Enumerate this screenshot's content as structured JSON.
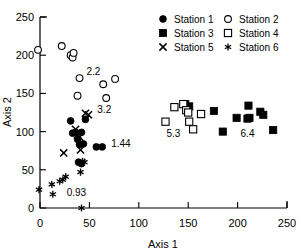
{
  "chart_data": {
    "type": "scatter",
    "title": "",
    "xlabel": "Axis 1",
    "ylabel": "Axis 2",
    "xlim": [
      0,
      250
    ],
    "ylim": [
      0,
      250
    ],
    "xticks": [
      0,
      50,
      100,
      150,
      200,
      250
    ],
    "yticks": [
      0,
      50,
      100,
      150,
      200,
      250
    ],
    "xtick_labels": [
      "0",
      "50",
      "100",
      "150",
      "200",
      "250"
    ],
    "ytick_labels": [
      "0",
      "50",
      "100",
      "150",
      "200",
      "250"
    ],
    "grid": false,
    "legend_position": "top-right",
    "series": [
      {
        "name": "Station 1",
        "marker": "filled-circle",
        "color": "#000000",
        "points": [
          [
            31,
            114
          ],
          [
            33,
            98
          ],
          [
            36,
            99
          ],
          [
            38,
            90
          ],
          [
            40,
            83
          ],
          [
            42,
            99
          ],
          [
            44,
            84
          ],
          [
            46,
            116
          ],
          [
            39,
            60
          ],
          [
            42,
            58
          ],
          [
            57,
            80
          ],
          [
            63,
            80
          ]
        ]
      },
      {
        "name": "Station 2",
        "marker": "open-circle",
        "color": "#000000",
        "points": [
          [
            -2,
            207
          ],
          [
            22,
            212
          ],
          [
            31,
            200
          ],
          [
            33,
            197
          ],
          [
            34,
            203
          ],
          [
            40,
            170
          ],
          [
            38,
            147
          ],
          [
            64,
            162
          ],
          [
            67,
            144
          ],
          [
            76,
            169
          ]
        ]
      },
      {
        "name": "Station 3",
        "marker": "filled-square",
        "color": "#000000",
        "points": [
          [
            147,
            136
          ],
          [
            151,
            133
          ],
          [
            176,
            127
          ],
          [
            185,
            100
          ],
          [
            199,
            118
          ],
          [
            210,
            117
          ],
          [
            211,
            134
          ],
          [
            212,
            118
          ],
          [
            223,
            126
          ],
          [
            226,
            122
          ],
          [
            236,
            102
          ]
        ]
      },
      {
        "name": "Station 4",
        "marker": "open-square",
        "color": "#000000",
        "points": [
          [
            127,
            113
          ],
          [
            136,
            132
          ],
          [
            145,
            136
          ],
          [
            148,
            128
          ],
          [
            150,
            125
          ],
          [
            151,
            113
          ],
          [
            155,
            103
          ],
          [
            163,
            123
          ]
        ]
      },
      {
        "name": "Station 5",
        "marker": "x",
        "color": "#000000",
        "points": [
          [
            24,
            72
          ],
          [
            36,
            103
          ],
          [
            38,
            96
          ],
          [
            40,
            93
          ],
          [
            41,
            76
          ],
          [
            46,
            124
          ],
          [
            49,
            122
          ]
        ]
      },
      {
        "name": "Station 6",
        "marker": "star",
        "color": "#000000",
        "points": [
          [
            -1,
            24
          ],
          [
            12,
            31
          ],
          [
            13,
            18
          ],
          [
            20,
            35
          ],
          [
            23,
            37
          ],
          [
            26,
            41
          ],
          [
            41,
            47
          ],
          [
            43,
            61
          ],
          [
            42,
            0
          ],
          [
            45,
            60
          ]
        ]
      }
    ],
    "annotations": [
      {
        "text": "2.2",
        "x": 47,
        "y": 174
      },
      {
        "text": "3.2",
        "x": 58,
        "y": 125
      },
      {
        "text": "1.44",
        "x": 72,
        "y": 80
      },
      {
        "text": "0.93",
        "x": 27,
        "y": 16
      },
      {
        "text": "5.3",
        "x": 128,
        "y": 93
      },
      {
        "text": "6.4",
        "x": 203,
        "y": 93
      }
    ]
  },
  "legend": {
    "entries": [
      {
        "label": "Station 1",
        "marker": "filled-circle"
      },
      {
        "label": "Station 2",
        "marker": "open-circle"
      },
      {
        "label": "Station 3",
        "marker": "filled-square"
      },
      {
        "label": "Station 4",
        "marker": "open-square"
      },
      {
        "label": "Station 5",
        "marker": "x"
      },
      {
        "label": "Station 6",
        "marker": "star"
      }
    ]
  }
}
